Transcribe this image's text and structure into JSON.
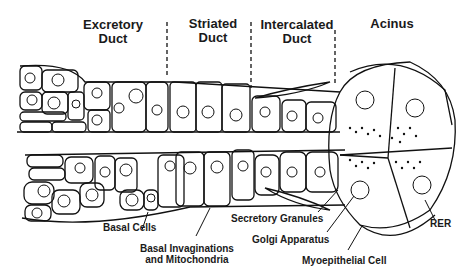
{
  "diagram": {
    "sections": [
      {
        "id": "excretory",
        "line1": "Excretory",
        "line2": "Duct"
      },
      {
        "id": "striated",
        "line1": "Striated",
        "line2": "Duct"
      },
      {
        "id": "intercalated",
        "line1": "Intercalated",
        "line2": "Duct"
      },
      {
        "id": "acinus",
        "line1": "Acinus",
        "line2": ""
      }
    ],
    "labels": {
      "basal_cells": "Basal Cells",
      "basal_invaginations_1": "Basal Invaginations",
      "basal_invaginations_2": "and Mitochondria",
      "secretory_granules": "Secretory Granules",
      "golgi_apparatus": "Golgi Apparatus",
      "myoepithelial_cell": "Myoepithelial Cell",
      "rer": "RER"
    },
    "colors": {
      "ink": "#111111",
      "background": "#ffffff"
    }
  }
}
